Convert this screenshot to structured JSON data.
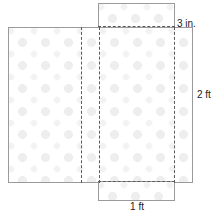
{
  "figure": {
    "pattern": {
      "name": "polka-dot",
      "dot_color": "#eeeeee",
      "background_color": "#ffffff"
    },
    "stroke": {
      "solid_color": "#9a9a9a",
      "dashed_color": "#5a5a5a"
    }
  },
  "panels": {
    "main": "main-sheet",
    "top_flap": "top-flap",
    "bottom_flap": "bottom-flap"
  },
  "folds": {
    "vertical_1": "fold-line-vertical-left",
    "vertical_2": "fold-line-vertical-inner",
    "vertical_3": "fold-line-vertical-right",
    "horizontal_top": "fold-line-horizontal-top",
    "horizontal_bottom": "fold-line-horizontal-bottom"
  },
  "labels": {
    "top": "3 in.",
    "right": "2 ft",
    "bottom": "1 ft"
  }
}
